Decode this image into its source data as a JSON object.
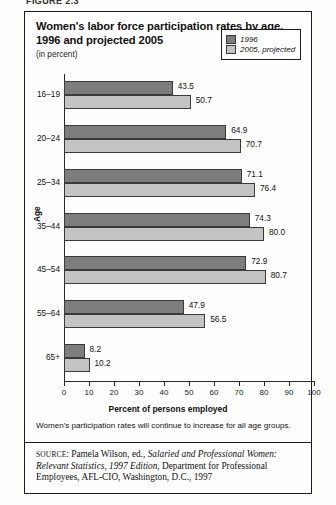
{
  "figure_label": "FIGURE 2.3",
  "title": "Women's labor force participation rates by age, 1996 and projected 2005",
  "subtitle": "(in percent)",
  "legend": {
    "items": [
      {
        "label": "1996",
        "color": "#7d7d7d"
      },
      {
        "label": "2005, projected",
        "color": "#c3c3c3"
      }
    ]
  },
  "caption": "Women's participation rates will continue to increase for all age groups.",
  "source": {
    "prefix": "SOURCE",
    "author": ": Pamela Wilson, ed., ",
    "work_italic": "Salaried and Professional Women: Relevant Statistics, 1997 Edition",
    "rest": ", Department for Professional Employees, AFL-CIO, Washington, D.C., 1997"
  },
  "chart_data": {
    "type": "bar",
    "orientation": "horizontal",
    "title": "Women's labor force participation rates by age, 1996 and projected 2005",
    "subtitle": "(in percent)",
    "xlabel": "Percent of persons employed",
    "ylabel": "Age",
    "xlim": [
      0,
      100
    ],
    "xticks": [
      0,
      10,
      20,
      30,
      40,
      50,
      60,
      70,
      80,
      90,
      100
    ],
    "grid": false,
    "legend_position": "top-right",
    "categories": [
      "16–19",
      "20–24",
      "25–34",
      "35–44",
      "45–54",
      "55–64",
      "65+"
    ],
    "series": [
      {
        "name": "1996",
        "color": "#7d7d7d",
        "values": [
          43.5,
          64.9,
          71.1,
          74.3,
          72.9,
          47.9,
          8.2
        ]
      },
      {
        "name": "2005, projected",
        "color": "#c3c3c3",
        "values": [
          50.7,
          70.7,
          76.4,
          80.0,
          80.7,
          56.5,
          10.2
        ]
      }
    ],
    "data_labels": [
      "43.5",
      "50.7",
      "64.9",
      "70.7",
      "71.1",
      "76.4",
      "74.3",
      "80.0",
      "72.9",
      "80.7",
      "47.9",
      "56.5",
      "8.2",
      "10.2"
    ]
  }
}
